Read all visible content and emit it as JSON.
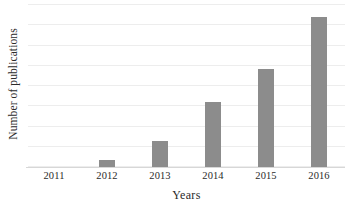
{
  "chart_data": {
    "type": "bar",
    "title": "",
    "xlabel": "Years",
    "ylabel": "Number of publications",
    "categories": [
      "2011",
      "2012",
      "2013",
      "2014",
      "2015",
      "2016"
    ],
    "values": [
      0,
      1,
      4,
      10,
      15,
      23
    ],
    "series": [
      {
        "name": "Number of publications",
        "values": [
          0,
          1,
          4,
          10,
          15,
          23
        ]
      }
    ],
    "ylim": [
      0,
      25
    ],
    "xlim_categories": 6,
    "grid": true,
    "grid_axis": "y",
    "grid_lines": 9,
    "legend": "none",
    "tick_labels_y": [],
    "bar_color": "#8c8c8c",
    "gridline_color": "#ededed",
    "axis_color": "#d7d7d7",
    "background_color": "#ffffff",
    "text_color": "#2b2b2b"
  },
  "axes": {
    "y_title": "Number of publications",
    "x_title": "Years"
  }
}
